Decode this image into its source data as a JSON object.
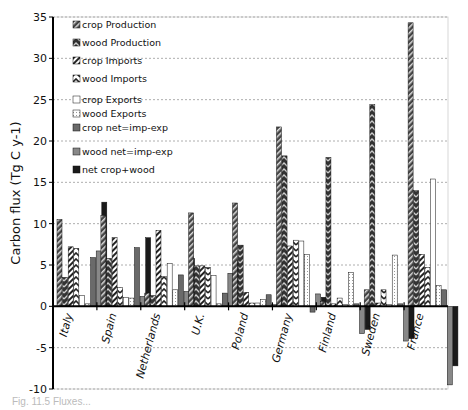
{
  "chart_data": {
    "type": "bar",
    "title": "",
    "xlabel": "",
    "ylabel": "Carbon flux  (Tg C y-1)",
    "ylim": [
      -10,
      35
    ],
    "yticks": [
      -10,
      -5,
      0,
      5,
      10,
      15,
      20,
      25,
      30,
      35
    ],
    "grid": "horizontal dotted",
    "legend_position": "upper-left inside",
    "categories": [
      "Italy",
      "Spain",
      "Netherlands",
      "U.K.",
      "Poland",
      "Germany",
      "Finland",
      "Sweden",
      "France"
    ],
    "series": [
      {
        "name": "crop Production",
        "pattern": "diag-dark",
        "values": [
          10.5,
          11.0,
          1.6,
          11.3,
          12.5,
          21.7,
          0.6,
          2.0,
          34.3
        ]
      },
      {
        "name": "wood Production",
        "pattern": "chevron-dark",
        "values": [
          3.5,
          5.8,
          1.3,
          4.9,
          7.4,
          18.2,
          18.0,
          24.4,
          14.0
        ]
      },
      {
        "name": "crop Imports",
        "pattern": "diag-light",
        "values": [
          7.2,
          8.3,
          9.2,
          4.9,
          1.7,
          7.3,
          0.3,
          0.4,
          6.3
        ]
      },
      {
        "name": "wood Imports",
        "pattern": "chevron-light",
        "values": [
          7.0,
          2.3,
          3.6,
          4.7,
          0.4,
          8.0,
          1.0,
          2.0,
          4.7
        ]
      },
      {
        "name": "crop Exports",
        "pattern": "white",
        "values": [
          1.3,
          1.1,
          5.2,
          3.7,
          0.4,
          7.9,
          0.2,
          0.2,
          15.4
        ]
      },
      {
        "name": "wood Exports",
        "pattern": "dotted-white",
        "values": [
          0.3,
          1.0,
          2.0,
          0.3,
          0.8,
          6.3,
          4.1,
          6.2,
          2.5
        ]
      },
      {
        "name": "crop net=imp-exp",
        "pattern": "gray",
        "values": [
          5.9,
          7.1,
          3.8,
          1.6,
          1.4,
          -0.7,
          0.3,
          0.3,
          2.0
        ]
      },
      {
        "name": "wood net=imp-exp",
        "pattern": "mid-gray",
        "values": [
          6.7,
          1.2,
          1.8,
          4.0,
          0.2,
          1.5,
          -3.3,
          -4.2,
          -9.5
        ]
      },
      {
        "name": "net crop+wood",
        "pattern": "black",
        "values": [
          12.6,
          8.3,
          5.8,
          5.6,
          1.1,
          1.1,
          -2.8,
          -3.9,
          -7.2
        ]
      }
    ]
  },
  "legend": {
    "items": [
      "crop Production",
      "wood Production",
      "crop Imports",
      "wood Imports",
      "crop Exports",
      "wood Exports",
      "crop net=imp-exp",
      "wood net=imp-exp",
      "net crop+wood"
    ]
  },
  "caption": "Fig. 11.5  Fluxes..."
}
